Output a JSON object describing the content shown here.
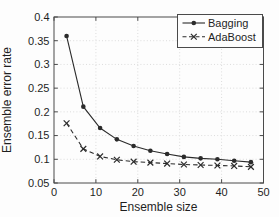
{
  "figure": {
    "background": "#fdfdfd",
    "axis_color": "#4a4a4a",
    "grid_color": "#dcdcdc",
    "text_color": "#1f1f1f",
    "series_color": "#2b2b2b",
    "legend_fill": "#fdfdfd"
  },
  "chart_data": {
    "type": "line",
    "title": "",
    "xlabel": "Ensemble size",
    "ylabel": "Ensemble error rate",
    "xlim": [
      0,
      50
    ],
    "ylim": [
      0.05,
      0.4
    ],
    "xticks": [
      0,
      10,
      20,
      30,
      40,
      50
    ],
    "yticks": [
      0.05,
      0.1,
      0.15,
      0.2,
      0.25,
      0.3,
      0.35,
      0.4
    ],
    "xtick_labels": [
      "0",
      "10",
      "20",
      "30",
      "40",
      "50"
    ],
    "ytick_labels": [
      "0.05",
      "0.1",
      "0.15",
      "0.2",
      "0.25",
      "0.3",
      "0.35",
      "0.4"
    ],
    "grid": true,
    "grid_style": "dotted",
    "legend_position": "top-right",
    "x": [
      3,
      7,
      11,
      15,
      19,
      23,
      27,
      31,
      35,
      39,
      43,
      47
    ],
    "series": [
      {
        "name": "Bagging",
        "marker": "circle",
        "line_style": "solid",
        "values": [
          0.36,
          0.211,
          0.166,
          0.142,
          0.128,
          0.118,
          0.111,
          0.105,
          0.102,
          0.1,
          0.097,
          0.094
        ]
      },
      {
        "name": "AdaBoost",
        "marker": "x",
        "line_style": "dashed",
        "values": [
          0.176,
          0.122,
          0.106,
          0.099,
          0.095,
          0.093,
          0.091,
          0.089,
          0.088,
          0.087,
          0.086,
          0.084
        ]
      }
    ]
  }
}
